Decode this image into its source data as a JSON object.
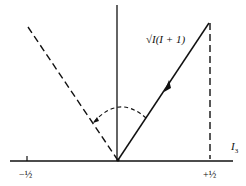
{
  "diagram": {
    "vector_label": "√I(I + 1)",
    "axis_label": "I",
    "axis_label_sub": "3",
    "tick_left_label": "−½",
    "tick_right_label": "+½",
    "colors": {
      "line": "#111111",
      "background": "#ffffff"
    }
  }
}
